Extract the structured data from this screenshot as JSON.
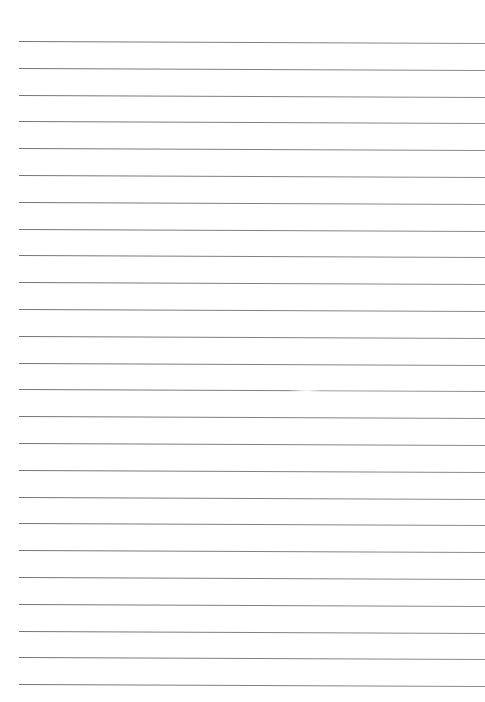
{
  "page": {
    "type": "lined-paper",
    "background_color": "#ffffff",
    "line_color": "#7a7a7a",
    "line_count": 25,
    "first_line_y": 41,
    "line_spacing": 26.8,
    "line_left_x": 19,
    "line_right_x": 485
  },
  "lines": [
    {
      "index": 1
    },
    {
      "index": 2
    },
    {
      "index": 3
    },
    {
      "index": 4
    },
    {
      "index": 5
    },
    {
      "index": 6
    },
    {
      "index": 7
    },
    {
      "index": 8
    },
    {
      "index": 9
    },
    {
      "index": 10
    },
    {
      "index": 11
    },
    {
      "index": 12
    },
    {
      "index": 13
    },
    {
      "index": 14,
      "faint_gap": true
    },
    {
      "index": 15
    },
    {
      "index": 16
    },
    {
      "index": 17
    },
    {
      "index": 18
    },
    {
      "index": 19
    },
    {
      "index": 20
    },
    {
      "index": 21
    },
    {
      "index": 22
    },
    {
      "index": 23
    },
    {
      "index": 24
    },
    {
      "index": 25
    }
  ]
}
